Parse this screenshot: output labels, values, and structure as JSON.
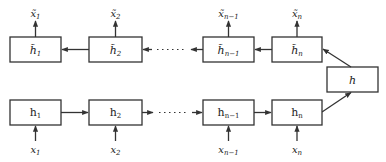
{
  "diagram": {
    "type": "sequence-autoencoder",
    "decoder_row": {
      "cells": [
        {
          "label": "h̃",
          "sub": "1",
          "output": "x̃",
          "output_sub": "1"
        },
        {
          "label": "h̃",
          "sub": "2",
          "output": "x̃",
          "output_sub": "2"
        },
        {
          "label": "h̃",
          "sub": "n−1",
          "output": "x̃",
          "output_sub": "n−1"
        },
        {
          "label": "h̃",
          "sub": "n",
          "output": "x̃",
          "output_sub": "n"
        }
      ],
      "direction": "right-to-left"
    },
    "encoder_row": {
      "cells": [
        {
          "label": "h",
          "sub": "1",
          "input": "x",
          "input_sub": "1"
        },
        {
          "label": "h",
          "sub": "2",
          "input": "x",
          "input_sub": "2"
        },
        {
          "label": "h",
          "sub": "n−1",
          "input": "x",
          "input_sub": "n−1"
        },
        {
          "label": "h",
          "sub": "n",
          "input": "x",
          "input_sub": "n"
        }
      ],
      "direction": "left-to-right"
    },
    "bottleneck": {
      "label": "h"
    },
    "ellipsis": "······",
    "colors": {
      "stroke": "#333333",
      "background": "#ffffff"
    }
  }
}
